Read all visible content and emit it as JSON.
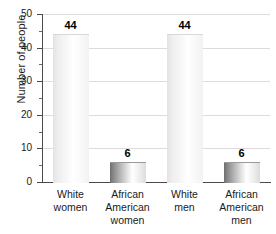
{
  "chart_data": {
    "type": "bar",
    "title": "",
    "xlabel": "",
    "ylabel": "Number of people",
    "categories": [
      "White women",
      "African American women",
      "White men",
      "African American men"
    ],
    "category_lines": [
      [
        "White",
        "women"
      ],
      [
        "African",
        "American",
        "women"
      ],
      [
        "White",
        "men"
      ],
      [
        "African",
        "American",
        "men"
      ]
    ],
    "values": [
      44,
      6,
      44,
      6
    ],
    "value_labels": [
      "44",
      "6",
      "44",
      "6"
    ],
    "ylim": [
      0,
      50
    ],
    "yticks": [
      0,
      10,
      20,
      30,
      40,
      50
    ],
    "ytick_labels": [
      "0",
      "10",
      "20",
      "30",
      "40",
      "50"
    ],
    "yminor_ticks": [
      5,
      15,
      25,
      35,
      45
    ],
    "grid": true,
    "grid_axis": "y",
    "legend": null,
    "colors": {
      "gridline": "#dcdcdc",
      "axis": "#4a4a4a",
      "text": "#1a1a1a",
      "bar_tall_light": "#ffffff",
      "bar_tall_edge": "#e3e3e3",
      "bar_short_dark": "#6f6f6f",
      "bar_short_light": "#ffffff"
    }
  }
}
